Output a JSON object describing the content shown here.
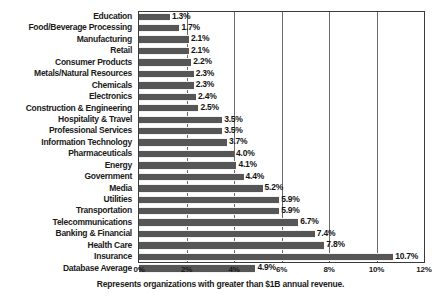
{
  "chart_data": {
    "type": "bar",
    "orientation": "horizontal",
    "title": "",
    "xlabel": "",
    "ylabel": "",
    "xlim": [
      0,
      12
    ],
    "xticks": [
      "0%",
      "2%",
      "4%",
      "6%",
      "8%",
      "10%",
      "12%"
    ],
    "xtick_values": [
      0,
      2,
      4,
      6,
      8,
      10,
      12
    ],
    "grid": true,
    "grid_axis": "x",
    "legend": false,
    "footnote": "Represents organizations with greater than $1B annual revenue.",
    "bar_color": "#565656",
    "categories": [
      "Education",
      "Food/Beverage Processing",
      "Manufacturing",
      "Retail",
      "Consumer Products",
      "Metals/Natural Resources",
      "Chemicals",
      "Electronics",
      "Construction & Engineering",
      "Hospitality & Travel",
      "Professional Services",
      "Information Technology",
      "Pharmaceuticals",
      "Energy",
      "Government",
      "Media",
      "Utilities",
      "Transportation",
      "Telecommunications",
      "Banking & Financial",
      "Health Care",
      "Insurance",
      "Database Average"
    ],
    "values": [
      1.3,
      1.7,
      2.1,
      2.1,
      2.2,
      2.3,
      2.3,
      2.4,
      2.5,
      3.5,
      3.5,
      3.7,
      4.0,
      4.1,
      4.4,
      5.2,
      5.9,
      5.9,
      6.7,
      7.4,
      7.8,
      10.7,
      4.9
    ],
    "data_labels": [
      "1.3%",
      "1.7%",
      "2.1%",
      "2.1%",
      "2.2%",
      "2.3%",
      "2.3%",
      "2.4%",
      "2.5%",
      "3.5%",
      "3.5%",
      "3.7%",
      "4.0%",
      "4.1%",
      "4.4%",
      "5.2%",
      "5.9%",
      "5.9%",
      "6.7%",
      "7.4%",
      "7.8%",
      "10.7%",
      "4.9%"
    ]
  }
}
